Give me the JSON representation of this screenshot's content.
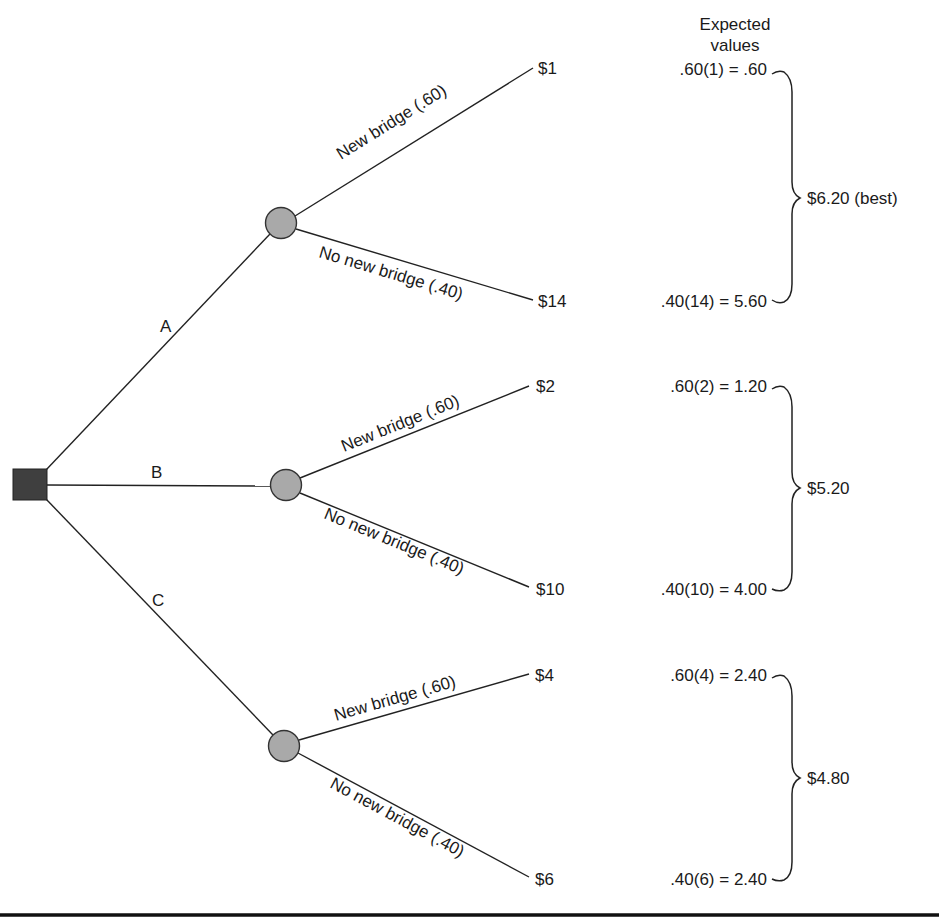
{
  "header": {
    "title_line1": "Expected",
    "title_line2": "values"
  },
  "decision_node": {
    "shape": "square",
    "color": "#3f3f3f"
  },
  "alternatives": [
    {
      "label": "A",
      "branches": [
        {
          "event": "New bridge (.60)",
          "probability": 0.6,
          "payoff": "$1",
          "expected_value_expr": ".60(1) = .60"
        },
        {
          "event": "No new bridge (.40)",
          "probability": 0.4,
          "payoff": "$14",
          "expected_value_expr": ".40(14) = 5.60"
        }
      ],
      "total": "$6.20 (best)"
    },
    {
      "label": "B",
      "branches": [
        {
          "event": "New bridge (.60)",
          "probability": 0.6,
          "payoff": "$2",
          "expected_value_expr": ".60(2) = 1.20"
        },
        {
          "event": "No new bridge (.40)",
          "probability": 0.4,
          "payoff": "$10",
          "expected_value_expr": ".40(10) = 4.00"
        }
      ],
      "total": "$5.20"
    },
    {
      "label": "C",
      "branches": [
        {
          "event": "New bridge (.60)",
          "probability": 0.6,
          "payoff": "$4",
          "expected_value_expr": ".60(4) = 2.40"
        },
        {
          "event": "No new bridge (.40)",
          "probability": 0.4,
          "payoff": "$6",
          "expected_value_expr": ".40(6) = 2.40"
        }
      ],
      "total": "$4.80"
    }
  ],
  "colors": {
    "chance_node": "#a9a9a9",
    "decision_node": "#3f3f3f",
    "line": "#222222",
    "background": "#ffffff"
  }
}
